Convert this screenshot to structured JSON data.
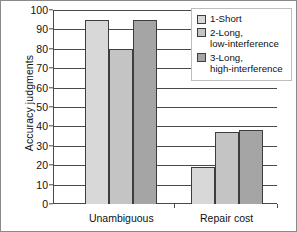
{
  "chart_data": {
    "type": "bar",
    "title": "",
    "xlabel": "",
    "ylabel": "Accuracy judgments",
    "ylim": [
      0,
      100
    ],
    "ytick_step": 10,
    "yticks": [
      0,
      10,
      20,
      30,
      40,
      50,
      60,
      70,
      80,
      90,
      100
    ],
    "ytick_labels": [
      "0",
      "10",
      "20",
      "30",
      "40",
      "50",
      "60",
      "70",
      "80",
      "90",
      "100"
    ],
    "categories": [
      "Unambiguous",
      "Repair cost"
    ],
    "series": [
      {
        "name": "1-Short",
        "values": [
          95,
          19
        ],
        "color": "#d8d8d8"
      },
      {
        "name": "2-Long,\nlow-interference",
        "values": [
          80,
          37
        ],
        "color": "#c4c4c4"
      },
      {
        "name": "3-Long,\nhigh-interference",
        "values": [
          95,
          38
        ],
        "color": "#a5a5a5"
      }
    ],
    "grid": true,
    "grid_axis": "y",
    "legend_position": "top-right",
    "bar_edge_color": "#3d3d3d",
    "axis_color": "#4a4a4a",
    "background": "#ffffff"
  }
}
